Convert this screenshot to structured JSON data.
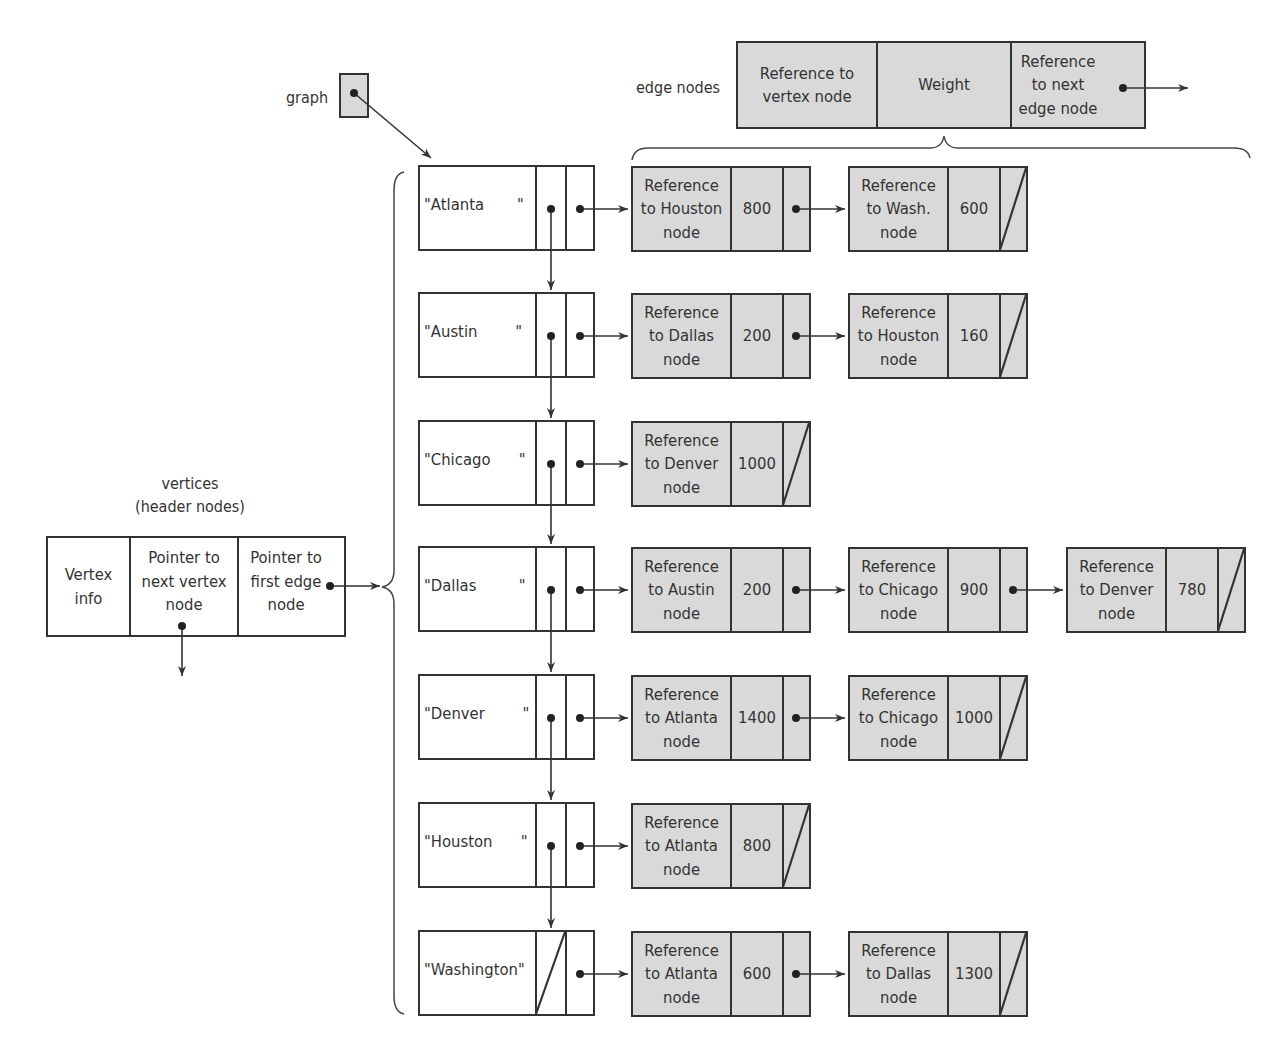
{
  "labels": {
    "graph": "graph",
    "edge_nodes": "edge nodes",
    "vertices_line1": "vertices",
    "vertices_line2": "(header nodes)"
  },
  "legend_edge_node": {
    "field1": "Reference to vertex node",
    "field2": "Weight",
    "field3": "Reference to next edge node"
  },
  "legend_vertex_node": {
    "field1": "Vertex info",
    "field2": "Pointer to next vertex node",
    "field3": "Pointer to first edge node"
  },
  "vertices": [
    {
      "name": "\"Atlanta       \"",
      "edges": [
        {
          "ref": "Reference to Houston node",
          "weight": "800"
        },
        {
          "ref": "Reference to Wash. node",
          "weight": "600"
        }
      ]
    },
    {
      "name": "\"Austin        \"",
      "edges": [
        {
          "ref": "Reference to Dallas node",
          "weight": "200"
        },
        {
          "ref": "Reference to Houston node",
          "weight": "160"
        }
      ]
    },
    {
      "name": "\"Chicago      \"",
      "edges": [
        {
          "ref": "Reference to Denver node",
          "weight": "1000"
        }
      ]
    },
    {
      "name": "\"Dallas         \"",
      "edges": [
        {
          "ref": "Reference to Austin node",
          "weight": "200"
        },
        {
          "ref": "Reference to Chicago node",
          "weight": "900"
        },
        {
          "ref": "Reference to Denver node",
          "weight": "780"
        }
      ]
    },
    {
      "name": "\"Denver        \"",
      "edges": [
        {
          "ref": "Reference to Atlanta node",
          "weight": "1400"
        },
        {
          "ref": "Reference to Chicago node",
          "weight": "1000"
        }
      ]
    },
    {
      "name": "\"Houston      \"",
      "edges": [
        {
          "ref": "Reference to Atlanta node",
          "weight": "800"
        }
      ]
    },
    {
      "name": "\"Washington\"",
      "edges": [
        {
          "ref": "Reference to Atlanta node",
          "weight": "600"
        },
        {
          "ref": "Reference to Dallas node",
          "weight": "1300"
        }
      ]
    }
  ],
  "colors": {
    "edge_fill": "#d9d9d9",
    "line": "#333333"
  }
}
